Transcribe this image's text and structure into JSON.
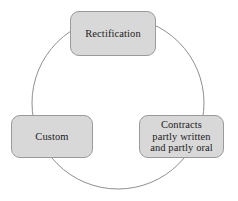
{
  "diagram": {
    "type": "cycle",
    "title": "",
    "background_color": "#ffffff",
    "circle": {
      "name": "cycle-circle",
      "center_x": 118,
      "center_y": 103,
      "radius": 86,
      "stroke_color": "#8f8f8f",
      "stroke_width": 1,
      "fill": "none"
    },
    "node_style": {
      "fill_color": "#d8d8d8",
      "border_color": "#9a9a9a",
      "text_color": "#1c1c1c",
      "corner_radius": 9
    },
    "nodes": [
      {
        "id": "rectification",
        "label": "Rectification",
        "position": "top"
      },
      {
        "id": "contracts",
        "label": "Contracts\npartly written\nand partly oral",
        "position": "bottom-right"
      },
      {
        "id": "custom",
        "label": "Custom",
        "position": "bottom-left"
      }
    ]
  }
}
